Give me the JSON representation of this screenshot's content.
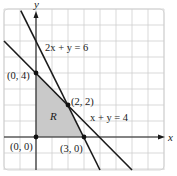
{
  "chart_data": {
    "type": "line",
    "title": "",
    "xlabel": "x",
    "ylabel": "y",
    "xlim": [
      -2,
      8
    ],
    "ylim": [
      -2,
      8
    ],
    "grid": true,
    "legend": null,
    "series": [
      {
        "name": "2x + y = 6",
        "equation": "2x + y = 6",
        "points": [
          [
            -0.95,
            7.9
          ],
          [
            4.0,
            -2.0
          ]
        ],
        "color": "#1a1a1a"
      },
      {
        "name": "x + y = 4",
        "equation": "x + y = 4",
        "points": [
          [
            -2.0,
            6.0
          ],
          [
            6.0,
            -2.0
          ]
        ],
        "color": "#1a1a1a"
      }
    ],
    "region": {
      "label": "R",
      "vertices": [
        [
          0,
          0
        ],
        [
          0,
          4
        ],
        [
          2,
          2
        ],
        [
          3,
          0
        ]
      ],
      "fill": "#c9c9c9"
    },
    "annotations": [
      {
        "text": "(0, 4)",
        "point": [
          0,
          4
        ]
      },
      {
        "text": "(2, 2)",
        "point": [
          2,
          2
        ]
      },
      {
        "text": "(0, 0)",
        "point": [
          0,
          0
        ]
      },
      {
        "text": "(3, 0)",
        "point": [
          3,
          0
        ]
      },
      {
        "text": "2x + y = 6",
        "anchor": [
          0.6,
          5.6
        ]
      },
      {
        "text": "x + y = 4",
        "anchor": [
          3.4,
          1.2
        ]
      },
      {
        "text": "R",
        "anchor": [
          1.0,
          1.3
        ]
      }
    ]
  },
  "labels": {
    "x_axis": "x",
    "y_axis": "y",
    "line1": "2x + y = 6",
    "line2": "x + y = 4",
    "region": "R",
    "p_0_4": "(0, 4)",
    "p_2_2": "(2, 2)",
    "p_0_0": "(0, 0)",
    "p_3_0": "(3, 0)"
  },
  "colors": {
    "grid": "#cfcfcf",
    "axis": "#1a1a1a",
    "line": "#1a1a1a",
    "region": "#c9c9c9",
    "point": "#111111"
  }
}
